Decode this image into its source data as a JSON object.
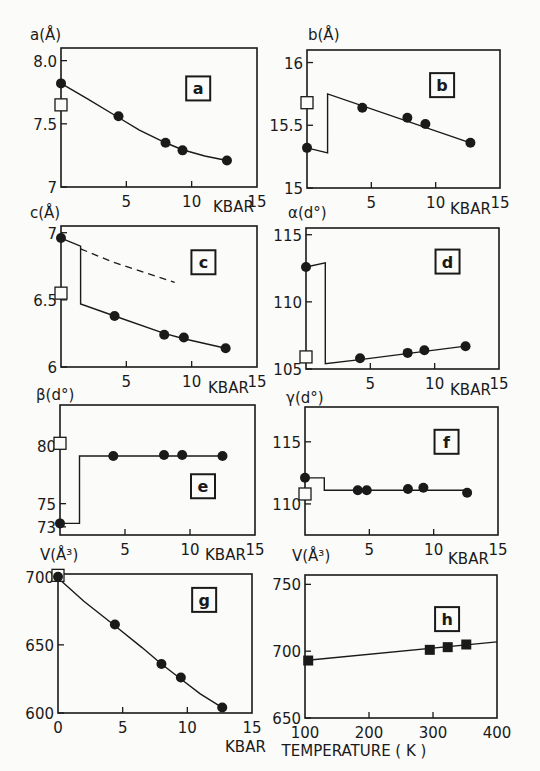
{
  "figure": {
    "background": "#fbfbf9",
    "ink": "#1a1a1a"
  },
  "chart_data": [
    {
      "panel": "a",
      "type": "line",
      "ylabel": "a(Å)",
      "xlabel": "KBAR",
      "xlim": [
        0,
        15
      ],
      "ylim": [
        7.0,
        8.1
      ],
      "xticks": [
        5,
        10,
        15
      ],
      "yticks": [
        {
          "v": 8.0,
          "label": "8.0"
        },
        {
          "v": 7.5,
          "label": "7.5"
        },
        {
          "v": 7.0,
          "label": "7"
        }
      ],
      "points": [
        [
          0,
          7.82
        ],
        [
          4.4,
          7.56
        ],
        [
          8.0,
          7.35
        ],
        [
          9.3,
          7.29
        ],
        [
          12.7,
          7.21
        ]
      ],
      "curve": [
        [
          0,
          7.82
        ],
        [
          2,
          7.7
        ],
        [
          4.4,
          7.55
        ],
        [
          6,
          7.45
        ],
        [
          8,
          7.35
        ],
        [
          9.3,
          7.295
        ],
        [
          11,
          7.245
        ],
        [
          12.7,
          7.21
        ]
      ],
      "open_square": [
        0,
        7.65
      ],
      "label_box": {
        "text": "a",
        "x": 10.5,
        "y": 7.78
      }
    },
    {
      "panel": "b",
      "type": "line",
      "ylabel": "b(Å)",
      "xlabel": "KBAR",
      "xlim": [
        0,
        15
      ],
      "ylim": [
        15.0,
        16.1
      ],
      "xticks": [
        5,
        10,
        15
      ],
      "yticks": [
        {
          "v": 16,
          "label": "16"
        },
        {
          "v": 15.5,
          "label": "15.5"
        },
        {
          "v": 15,
          "label": "15"
        }
      ],
      "points": [
        [
          0,
          15.32
        ],
        [
          4.3,
          15.64
        ],
        [
          7.8,
          15.56
        ],
        [
          9.2,
          15.51
        ],
        [
          12.7,
          15.36
        ]
      ],
      "curve": [
        [
          0,
          15.32
        ],
        [
          1.6,
          15.28
        ],
        [
          1.6,
          15.75
        ],
        [
          12.7,
          15.36
        ]
      ],
      "open_square": [
        0,
        15.68
      ],
      "label_box": {
        "text": "b",
        "x": 10.5,
        "y": 15.82
      }
    },
    {
      "panel": "c",
      "type": "line",
      "ylabel": "c(Å)",
      "xlabel": "KBAR",
      "xlim": [
        0,
        15
      ],
      "ylim": [
        6.0,
        7.05
      ],
      "xticks": [
        5,
        10,
        15
      ],
      "yticks": [
        {
          "v": 7,
          "label": "7"
        },
        {
          "v": 6.5,
          "label": "6.5"
        },
        {
          "v": 6,
          "label": "6"
        }
      ],
      "points": [
        [
          0,
          6.96
        ],
        [
          4.1,
          6.38
        ],
        [
          7.9,
          6.24
        ],
        [
          9.4,
          6.22
        ],
        [
          12.6,
          6.14
        ]
      ],
      "curve": [
        [
          0,
          6.96
        ],
        [
          1.5,
          6.9
        ],
        [
          1.5,
          6.47
        ],
        [
          4.1,
          6.38
        ],
        [
          7.9,
          6.25
        ],
        [
          9.4,
          6.21
        ],
        [
          12.6,
          6.14
        ]
      ],
      "dashed_curve": [
        [
          1.5,
          6.88
        ],
        [
          4,
          6.78
        ],
        [
          6.5,
          6.7
        ],
        [
          8.7,
          6.63
        ]
      ],
      "open_square": [
        0,
        6.55
      ],
      "label_box": {
        "text": "c",
        "x": 10.9,
        "y": 6.78
      }
    },
    {
      "panel": "d",
      "type": "line",
      "ylabel": "α(d°)",
      "xlabel": "KBAR",
      "xlim": [
        0,
        15
      ],
      "ylim": [
        105,
        115.5
      ],
      "xticks": [
        5,
        10,
        15
      ],
      "yticks": [
        {
          "v": 115,
          "label": "115"
        },
        {
          "v": 110,
          "label": "110"
        },
        {
          "v": 105,
          "label": "105"
        }
      ],
      "points": [
        [
          0,
          112.6
        ],
        [
          4.2,
          105.8
        ],
        [
          7.9,
          106.2
        ],
        [
          9.2,
          106.4
        ],
        [
          12.4,
          106.7
        ]
      ],
      "curve": [
        [
          0,
          112.6
        ],
        [
          1.5,
          112.9
        ],
        [
          1.5,
          105.4
        ],
        [
          4.2,
          105.7
        ],
        [
          12.4,
          106.7
        ]
      ],
      "open_square": [
        0,
        105.9
      ],
      "label_box": {
        "text": "d",
        "x": 11.0,
        "y": 113.0
      }
    },
    {
      "panel": "e",
      "type": "line",
      "ylabel": "β(d°)",
      "xlabel": "KBAR",
      "xlim": [
        0,
        15
      ],
      "ylim": [
        72.3,
        83.5
      ],
      "xticks": [
        5,
        10,
        15
      ],
      "yticks": [
        {
          "v": 80,
          "label": "80"
        },
        {
          "v": 75,
          "label": "75"
        },
        {
          "v": 73,
          "label": "73"
        }
      ],
      "points": [
        [
          0,
          73.3
        ],
        [
          4.1,
          79.1
        ],
        [
          8.0,
          79.2
        ],
        [
          9.4,
          79.2
        ],
        [
          12.5,
          79.1
        ]
      ],
      "curve": [
        [
          0,
          73.3
        ],
        [
          1.5,
          73.3
        ],
        [
          1.5,
          79.1
        ],
        [
          12.5,
          79.1
        ]
      ],
      "open_square": [
        0,
        80.2
      ],
      "label_box": {
        "text": "e",
        "x": 11.0,
        "y": 76.5
      }
    },
    {
      "panel": "f",
      "type": "line",
      "ylabel": "γ(d°)",
      "xlabel": "KBAR",
      "xlim": [
        0,
        15
      ],
      "ylim": [
        107.5,
        117.8
      ],
      "xticks": [
        5,
        10,
        15
      ],
      "yticks": [
        {
          "v": 115,
          "label": "115"
        },
        {
          "v": 110,
          "label": "110"
        }
      ],
      "points": [
        [
          0,
          112.1
        ],
        [
          4.1,
          111.1
        ],
        [
          4.8,
          111.1
        ],
        [
          8.0,
          111.2
        ],
        [
          9.2,
          111.3
        ],
        [
          12.6,
          110.9
        ]
      ],
      "curve": [
        [
          0,
          112.1
        ],
        [
          1.5,
          112.1
        ],
        [
          1.5,
          111.1
        ],
        [
          12.6,
          111.1
        ]
      ],
      "open_square": [
        0,
        110.8
      ],
      "label_box": {
        "text": "f",
        "x": 11.0,
        "y": 115.0
      }
    },
    {
      "panel": "g",
      "type": "line",
      "ylabel": "V(Å³)",
      "xlabel": "KBAR",
      "xlim": [
        0,
        15
      ],
      "ylim": [
        600,
        702
      ],
      "xticks": [
        0,
        5,
        10,
        15
      ],
      "yticks": [
        {
          "v": 700,
          "label": "700"
        },
        {
          "v": 650,
          "label": "650"
        },
        {
          "v": 600,
          "label": "600"
        }
      ],
      "points": [
        [
          0,
          700
        ],
        [
          4.4,
          665
        ],
        [
          8.0,
          636
        ],
        [
          9.5,
          626
        ],
        [
          12.7,
          604
        ]
      ],
      "curve": [
        [
          0,
          699
        ],
        [
          2,
          682
        ],
        [
          4.4,
          664
        ],
        [
          6.5,
          648
        ],
        [
          8,
          636
        ],
        [
          9.5,
          625
        ],
        [
          11,
          614
        ],
        [
          12.7,
          604
        ]
      ],
      "open_square": [
        0,
        701
      ],
      "label_box": {
        "text": "g",
        "x": 11.3,
        "y": 683
      }
    },
    {
      "panel": "h",
      "type": "line",
      "ylabel": "V(Å³)",
      "xlabel": "TEMPERATURE ( K )",
      "xlim": [
        100,
        400
      ],
      "ylim": [
        650,
        757
      ],
      "xticks": [
        100,
        200,
        300,
        400
      ],
      "yticks": [
        {
          "v": 750,
          "label": "750"
        },
        {
          "v": 700,
          "label": "700"
        },
        {
          "v": 650,
          "label": "650"
        }
      ],
      "points": [
        [
          105,
          693
        ],
        [
          295,
          701
        ],
        [
          323,
          703
        ],
        [
          352,
          705
        ]
      ],
      "marker": "square",
      "curve": [
        [
          100,
          693
        ],
        [
          400,
          707
        ]
      ],
      "label_box": {
        "text": "h",
        "x": 322,
        "y": 724
      }
    }
  ]
}
